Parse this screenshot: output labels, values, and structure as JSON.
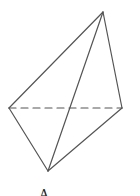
{
  "diagram": {
    "type": "tetrahedron",
    "stroke_color": "#555555",
    "vertices": {
      "top": [
        103,
        12
      ],
      "left": [
        9,
        108
      ],
      "right": [
        122,
        108
      ],
      "bottom": [
        48,
        171
      ]
    },
    "edges": [
      {
        "from": "top",
        "to": "left",
        "style": "solid"
      },
      {
        "from": "top",
        "to": "right",
        "style": "solid"
      },
      {
        "from": "top",
        "to": "bottom",
        "style": "solid"
      },
      {
        "from": "left",
        "to": "bottom",
        "style": "solid"
      },
      {
        "from": "right",
        "to": "bottom",
        "style": "solid"
      },
      {
        "from": "left",
        "to": "right",
        "style": "dashed"
      }
    ],
    "caption": "A"
  }
}
